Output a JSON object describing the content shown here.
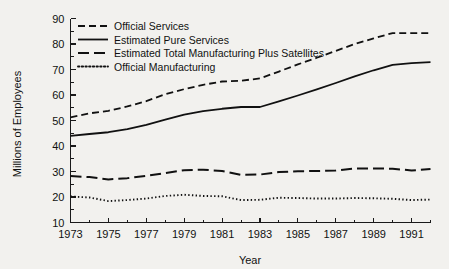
{
  "chart_data": {
    "type": "line",
    "title": "",
    "xlabel": "Year",
    "ylabel": "Millions of Employees",
    "xlim": [
      1973,
      1992
    ],
    "ylim": [
      10,
      90
    ],
    "ytick_step": 10,
    "ytick_minor_step": 5,
    "xtick_step": 1,
    "xtick_label_step": 2,
    "grid": false,
    "legend_position": "top-left",
    "x": [
      1973,
      1974,
      1975,
      1976,
      1977,
      1978,
      1979,
      1980,
      1981,
      1982,
      1983,
      1984,
      1985,
      1986,
      1987,
      1988,
      1989,
      1990,
      1991,
      1992
    ],
    "xtick_labels": [
      "1973",
      "1975",
      "1977",
      "1979",
      "1981",
      "1983",
      "1985",
      "1987",
      "1989",
      "1991"
    ],
    "ytick_labels": [
      "10",
      "20",
      "30",
      "40",
      "50",
      "60",
      "70",
      "80",
      "90"
    ],
    "series": [
      {
        "name": "Official Services",
        "style": "dashed",
        "dash": "7,4",
        "width": 1.8,
        "values": [
          51.2,
          52.8,
          53.8,
          55.5,
          57.6,
          60.3,
          62.3,
          64.0,
          65.3,
          65.6,
          66.5,
          69.2,
          72.0,
          74.6,
          77.3,
          80.0,
          82.2,
          84.3,
          84.3,
          84.3
        ]
      },
      {
        "name": "Estimated Pure Services",
        "style": "solid",
        "dash": "none",
        "width": 1.8,
        "values": [
          44.0,
          44.7,
          45.4,
          46.6,
          48.3,
          50.3,
          52.3,
          53.7,
          54.6,
          55.3,
          55.3,
          57.5,
          59.8,
          62.2,
          64.7,
          67.3,
          69.7,
          71.8,
          72.5,
          72.9
        ]
      },
      {
        "name": "Estimated Total Manufacturing Plus Satellites",
        "style": "long-dashed",
        "dash": "11,5",
        "width": 2.0,
        "values": [
          28.2,
          27.8,
          26.9,
          27.4,
          28.3,
          29.4,
          30.5,
          30.7,
          30.2,
          28.7,
          28.8,
          29.8,
          30.1,
          30.2,
          30.4,
          31.2,
          31.2,
          31.1,
          30.4,
          31.0
        ]
      },
      {
        "name": "Official Manufacturing",
        "style": "dotted",
        "dash": "1.4,2.3",
        "width": 1.9,
        "values": [
          20.2,
          19.8,
          18.4,
          18.8,
          19.4,
          20.4,
          20.9,
          20.4,
          20.3,
          18.8,
          18.9,
          19.7,
          19.6,
          19.4,
          19.4,
          19.6,
          19.5,
          19.3,
          18.8,
          19.0
        ]
      }
    ]
  },
  "legend": {
    "entries": [
      {
        "label": "Official Services"
      },
      {
        "label": "Estimated Pure Services"
      },
      {
        "label": "Estimated Total Manufacturing Plus Satellites"
      },
      {
        "label": "Official Manufacturing"
      }
    ]
  },
  "colors": {
    "ink": "#111111",
    "background": "#f2f1ee"
  }
}
